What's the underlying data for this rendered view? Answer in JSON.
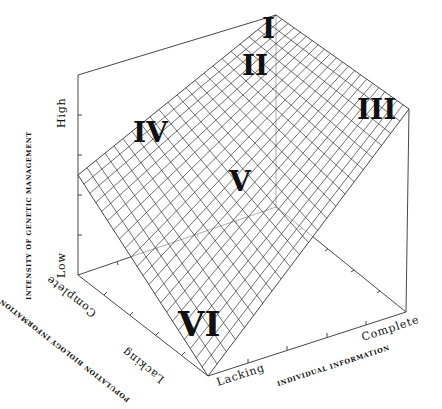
{
  "figure": {
    "type": "3d-surface-diagram",
    "z_axis": {
      "title": "INTENSITY OF GENETIC MANAGEMENT",
      "low_label": "Low",
      "high_label": "High"
    },
    "y_axis": {
      "title": "POPULATION BIOLOGY INFORMATION",
      "lacking_label": "Lacking",
      "complete_label": "Complete"
    },
    "x_axis": {
      "title": "INDIVIDUAL INFORMATION",
      "lacking_label": "Lacking",
      "complete_label": "Complete"
    },
    "regions": [
      {
        "id": "I",
        "label": "I"
      },
      {
        "id": "II",
        "label": "II"
      },
      {
        "id": "III",
        "label": "III"
      },
      {
        "id": "IV",
        "label": "IV"
      },
      {
        "id": "V",
        "label": "V"
      },
      {
        "id": "VI",
        "label": "VI"
      }
    ],
    "surface": {
      "description": "Planar mesh surface rising from Low (both informations lacking) to High (both complete)",
      "grid_divisions": 22
    },
    "colors": {
      "line": "#333333",
      "text": "#111111",
      "background": "#ffffff"
    }
  }
}
